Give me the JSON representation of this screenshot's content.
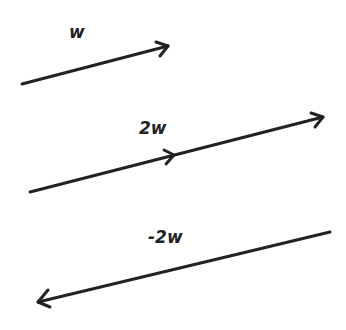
{
  "diagram": {
    "stroke_color": "#222222",
    "vectors": [
      {
        "label": "w",
        "from": [
          22,
          84
        ],
        "to": [
          168,
          46
        ],
        "label_pos": [
          67,
          20
        ]
      },
      {
        "label": "2w",
        "from": [
          30,
          192
        ],
        "to": [
          323,
          117
        ],
        "mid_arrow": [
          173,
          156
        ],
        "label_pos": [
          140,
          118
        ]
      },
      {
        "label": "-2w",
        "from": [
          330,
          232
        ],
        "to": [
          38,
          302
        ],
        "label_pos": [
          148,
          228
        ]
      }
    ]
  }
}
